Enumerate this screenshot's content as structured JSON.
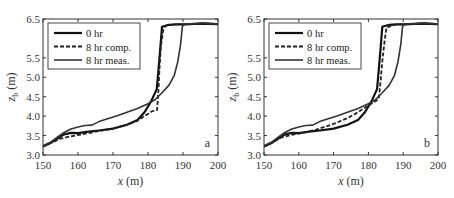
{
  "chart_data": [
    {
      "panel": "a",
      "type": "line",
      "xlabel": "x (m)",
      "ylabel": "z_b (m)",
      "xlim": [
        150,
        200
      ],
      "ylim": [
        3.0,
        6.5
      ],
      "xticks": [
        150,
        160,
        170,
        180,
        190,
        200
      ],
      "yticks": [
        3.0,
        3.5,
        4.0,
        4.5,
        5.0,
        5.5,
        6.5
      ],
      "legend": [
        "0 hr",
        "8 hr comp.",
        "8 hr meas."
      ],
      "legend_position": "upper left",
      "series": [
        {
          "name": "0 hr",
          "style": "solid-thick",
          "x": [
            150,
            152,
            154,
            156,
            158,
            160,
            163,
            166,
            170,
            174,
            177,
            179,
            181,
            182.5,
            183,
            183.5,
            184,
            186,
            188,
            190,
            195,
            200
          ],
          "y": [
            3.22,
            3.3,
            3.42,
            3.53,
            3.57,
            3.56,
            3.6,
            3.63,
            3.68,
            3.78,
            3.9,
            4.1,
            4.4,
            4.7,
            5.2,
            5.75,
            6.3,
            6.35,
            6.36,
            6.36,
            6.38,
            6.37
          ]
        },
        {
          "name": "8 hr comp.",
          "style": "dashed",
          "x": [
            150,
            152,
            155,
            158,
            161,
            165,
            170,
            174,
            177,
            179,
            181,
            182.6,
            183,
            183.3,
            183.7,
            184.3,
            185,
            188,
            190,
            195,
            200
          ],
          "y": [
            3.22,
            3.3,
            3.42,
            3.48,
            3.53,
            3.6,
            3.68,
            3.78,
            3.88,
            4.0,
            4.12,
            4.16,
            4.7,
            5.3,
            5.8,
            6.2,
            6.33,
            6.36,
            6.36,
            6.38,
            6.37
          ]
        },
        {
          "name": "8 hr meas.",
          "style": "solid",
          "x": [
            150,
            152,
            154,
            156,
            158,
            160,
            162,
            164,
            166,
            168,
            171,
            174,
            177,
            180,
            182,
            184,
            186,
            187.5,
            188.5,
            189.3,
            189.8,
            190.5,
            193,
            196,
            200
          ],
          "y": [
            3.24,
            3.32,
            3.45,
            3.58,
            3.67,
            3.72,
            3.76,
            3.77,
            3.86,
            3.92,
            4.0,
            4.1,
            4.2,
            4.32,
            4.42,
            4.6,
            4.8,
            5.05,
            5.4,
            5.85,
            6.3,
            6.38,
            6.38,
            6.4,
            6.37
          ]
        }
      ],
      "annotation": "a"
    },
    {
      "panel": "b",
      "type": "line",
      "xlabel": "x (m)",
      "ylabel": "z_b (m)",
      "xlim": [
        150,
        200
      ],
      "ylim": [
        3.0,
        6.5
      ],
      "xticks": [
        150,
        160,
        170,
        180,
        190,
        200
      ],
      "yticks": [
        3.0,
        3.5,
        4.0,
        4.5,
        5.0,
        5.5,
        6.5
      ],
      "legend": [
        "0 hr",
        "8 hr comp.",
        "8 hr meas."
      ],
      "legend_position": "upper left",
      "series": [
        {
          "name": "0 hr",
          "style": "solid-thick",
          "x": [
            150,
            152,
            154,
            156,
            158,
            160,
            163,
            166,
            170,
            174,
            177,
            179,
            181,
            182.5,
            183,
            183.5,
            184,
            186,
            188,
            190,
            195,
            200
          ],
          "y": [
            3.22,
            3.3,
            3.42,
            3.53,
            3.57,
            3.56,
            3.6,
            3.63,
            3.68,
            3.78,
            3.9,
            4.1,
            4.4,
            4.7,
            5.2,
            5.75,
            6.3,
            6.35,
            6.36,
            6.36,
            6.38,
            6.37
          ]
        },
        {
          "name": "8 hr comp.",
          "style": "dashed",
          "x": [
            150,
            152,
            155,
            158,
            161,
            165,
            170,
            174,
            177,
            180,
            182,
            183,
            183.5,
            184,
            184.6,
            185.2,
            188,
            190,
            195,
            200
          ],
          "y": [
            3.22,
            3.3,
            3.45,
            3.52,
            3.57,
            3.65,
            3.8,
            3.95,
            4.1,
            4.28,
            4.38,
            4.45,
            4.9,
            5.4,
            5.9,
            6.28,
            6.36,
            6.36,
            6.38,
            6.37
          ]
        },
        {
          "name": "8 hr meas.",
          "style": "solid",
          "x": [
            150,
            152,
            154,
            156,
            158,
            160,
            162,
            164,
            166,
            168,
            171,
            174,
            177,
            180,
            182,
            184,
            186,
            187.5,
            188.5,
            189.3,
            189.8,
            190.5,
            193,
            196,
            200
          ],
          "y": [
            3.24,
            3.32,
            3.45,
            3.58,
            3.67,
            3.72,
            3.76,
            3.77,
            3.86,
            3.92,
            4.0,
            4.1,
            4.2,
            4.32,
            4.42,
            4.6,
            4.8,
            5.05,
            5.4,
            5.85,
            6.3,
            6.38,
            6.38,
            6.4,
            6.37
          ]
        }
      ],
      "annotation": "b"
    }
  ],
  "panels": [
    {
      "letter": "a",
      "xlabel_var": "x",
      "xlabel_unit": "(m)",
      "ylabel_var": "z",
      "ylabel_sub": "b",
      "ylabel_unit": "(m)",
      "legend": [
        "0 hr",
        "8 hr comp.",
        "8 hr meas."
      ],
      "xtick_labels": [
        "150",
        "160",
        "170",
        "180",
        "190",
        "200"
      ],
      "ytick_labels": [
        "3.0",
        "3.5",
        "4.0",
        "4.5",
        "5.0",
        "5.5",
        "6.5"
      ]
    },
    {
      "letter": "b",
      "xlabel_var": "x",
      "xlabel_unit": "(m)",
      "ylabel_var": "z",
      "ylabel_sub": "b",
      "ylabel_unit": "(m)",
      "legend": [
        "0 hr",
        "8 hr comp.",
        "8 hr meas."
      ],
      "xtick_labels": [
        "150",
        "160",
        "170",
        "180",
        "190",
        "200"
      ],
      "ytick_labels": [
        "3.0",
        "3.5",
        "4.0",
        "4.5",
        "5.0",
        "5.5",
        "6.5"
      ]
    }
  ],
  "colors": {
    "axis": "#333333",
    "line_0hr": "#111111",
    "line_comp": "#222222",
    "line_meas": "#333333"
  }
}
